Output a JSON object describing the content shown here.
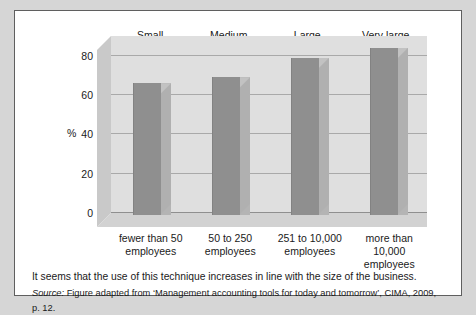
{
  "figure": {
    "category_header": [
      "Small",
      "Medium",
      "Large",
      "Very large"
    ],
    "caption": "It seems that the use of this technique increases in line with the size of the business.",
    "source_label": "Source:",
    "source_text": " Figure adapted from ‘Management accounting tools for today and tomorrow’, CIMA, 2009, p. 12."
  },
  "chart_data": {
    "type": "bar",
    "title": "",
    "xlabel": "",
    "ylabel": "%",
    "ylim": [
      0,
      90
    ],
    "yticks": [
      0,
      20,
      40,
      60,
      80
    ],
    "ytick_labels": [
      "0",
      "20",
      "40",
      "60",
      "80"
    ],
    "grid": true,
    "legend": null,
    "groups": [
      "Small",
      "Medium",
      "Large",
      "Very large"
    ],
    "categories": [
      "fewer than 50 employees",
      "50 to 250 employees",
      "251 to 10,000 employees",
      "more than 10,000 employees"
    ],
    "category_lines": [
      [
        "fewer than 50",
        "employees"
      ],
      [
        "50 to 250",
        "employees"
      ],
      [
        "251 to 10,000",
        "employees"
      ],
      [
        "more than",
        "10,000",
        "employees"
      ]
    ],
    "values": [
      67,
      70,
      80,
      85
    ],
    "colors": {
      "bar_front": "#8f8f8f",
      "bar_side": "#b0b0b0",
      "bar_top": "#c2c2c2",
      "back_wall": "#dfdfdf",
      "floor": "#d2d2d2",
      "left_wall": "#c9c9c9",
      "gridline": "#a9a9a9",
      "page_background": "#d6d6d6",
      "figure_background": "#ffffff",
      "figure_border": "#5f5f5f",
      "text": "#1a1a1a"
    }
  }
}
